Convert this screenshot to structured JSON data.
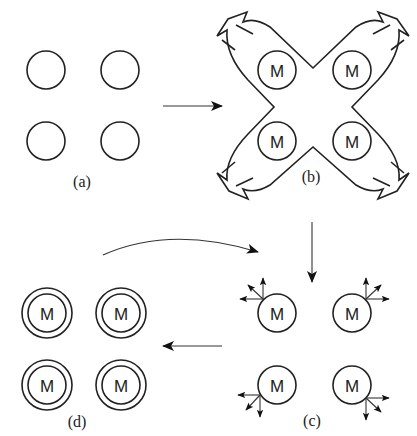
{
  "figure": {
    "panels": [
      {
        "id": "a",
        "label": "(a)",
        "description": "four empty circles"
      },
      {
        "id": "b",
        "label": "(b)",
        "description": "four M circles inside an X-shaped outline with outward arrows at each arm"
      },
      {
        "id": "c",
        "label": "(c)",
        "description": "four M circles each with three small outward arrows"
      },
      {
        "id": "d",
        "label": "(d)",
        "description": "four M circles each surrounded by a concentric ring"
      }
    ],
    "circle_label": "M",
    "flow": [
      "a -> b",
      "b -> c",
      "c -> d",
      "d -> c (curved return arrow)"
    ],
    "colors": {
      "line": "#222222",
      "background": "#ffffff"
    }
  }
}
